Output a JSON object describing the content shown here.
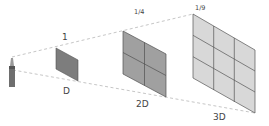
{
  "diagram": {
    "source": {
      "name": "light-source",
      "color": "#6e6e6e"
    },
    "panels": [
      {
        "intensity_label": "1",
        "distance_label": "D",
        "grid": 1,
        "fill": "#7d7d7d"
      },
      {
        "intensity_label": "1/4",
        "distance_label": "2D",
        "grid": 2,
        "fill": "#a0a0a0"
      },
      {
        "intensity_label": "1/9",
        "distance_label": "3D",
        "grid": 3,
        "fill": "#d8d8d8"
      }
    ],
    "colors": {
      "dashed_line": "#b5b5b5",
      "grid_line": "#555555",
      "label": "#444444"
    }
  }
}
